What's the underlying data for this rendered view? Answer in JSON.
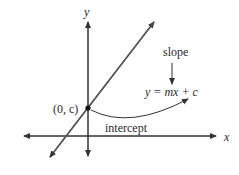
{
  "diagram": {
    "axis_labels": {
      "x": "x",
      "y": "y"
    },
    "point_label": "(0, c)",
    "slope_label": "slope",
    "equation": "y = mx + c",
    "intercept_label": "intercept",
    "colors": {
      "line": "#555555",
      "axis": "#333333",
      "text": "#2a2a2a"
    }
  }
}
